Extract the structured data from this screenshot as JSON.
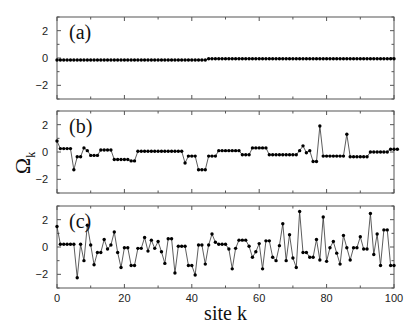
{
  "chart_data": {
    "type": "line",
    "xlabel": "site k",
    "ylabel": "Ω_k",
    "ylabel_main": "Ω",
    "ylabel_sub": "k",
    "xlim": [
      0,
      100
    ],
    "ylim": [
      -3,
      3
    ],
    "x_ticks": [
      0,
      20,
      40,
      60,
      80,
      100
    ],
    "y_ticks": [
      2,
      0,
      -2
    ],
    "y_tick_labels": [
      "2",
      "0",
      "−2"
    ],
    "x_tick_labels": [
      "0",
      "20",
      "40",
      "60",
      "80",
      "100"
    ],
    "grid": false,
    "markers": "filled-circle",
    "panels": [
      {
        "label": "(a)",
        "values": [
          -0.15,
          -0.15,
          -0.15,
          -0.15,
          -0.15,
          -0.15,
          -0.15,
          -0.15,
          -0.15,
          -0.15,
          -0.15,
          -0.15,
          -0.15,
          -0.15,
          -0.15,
          -0.15,
          -0.15,
          -0.15,
          -0.15,
          -0.15,
          -0.15,
          -0.15,
          -0.15,
          -0.15,
          -0.15,
          -0.15,
          -0.15,
          -0.15,
          -0.15,
          -0.15,
          -0.15,
          -0.15,
          -0.15,
          -0.15,
          -0.15,
          -0.15,
          -0.15,
          -0.15,
          -0.15,
          -0.15,
          -0.15,
          -0.15,
          -0.15,
          -0.15,
          -0.15,
          -0.05,
          -0.05,
          -0.05,
          -0.05,
          -0.05,
          -0.05,
          -0.05,
          -0.05,
          -0.05,
          -0.05,
          -0.05,
          -0.05,
          -0.05,
          -0.05,
          -0.05,
          -0.05,
          -0.05,
          -0.05,
          -0.05,
          -0.05,
          -0.05,
          -0.05,
          -0.05,
          -0.05,
          -0.05,
          -0.05,
          -0.05,
          -0.05,
          -0.05,
          -0.05,
          -0.05,
          -0.05,
          -0.05,
          -0.05,
          -0.05,
          -0.05,
          -0.05,
          -0.05,
          -0.05,
          -0.05,
          -0.05,
          -0.05,
          -0.05,
          -0.05,
          -0.05,
          -0.05,
          -0.05,
          -0.05,
          -0.05,
          -0.05,
          -0.05,
          -0.05,
          -0.05,
          -0.05,
          -0.05,
          -0.05
        ]
      },
      {
        "label": "(b)",
        "values": [
          0.8,
          0.25,
          0.25,
          0.25,
          0.25,
          -1.3,
          -0.35,
          -0.35,
          0.3,
          0.1,
          -0.25,
          -0.25,
          -0.25,
          0.15,
          0.15,
          0.15,
          0.15,
          -0.55,
          -0.55,
          -0.55,
          -0.55,
          -0.55,
          -0.65,
          -0.65,
          0.05,
          0.05,
          0.05,
          0.05,
          0.05,
          0.05,
          0.05,
          0.05,
          0.05,
          0.05,
          0.05,
          0.05,
          0.05,
          0.05,
          -0.8,
          -0.3,
          -0.3,
          -0.3,
          -1.3,
          -1.3,
          -1.3,
          -0.3,
          -0.3,
          -0.3,
          0.1,
          0.1,
          0.1,
          0.1,
          0.1,
          0.1,
          0.1,
          -0.2,
          -0.2,
          -0.2,
          0.3,
          0.3,
          0.3,
          0.3,
          0.3,
          -0.2,
          -0.2,
          -0.2,
          -0.2,
          -0.2,
          -0.2,
          -0.2,
          -0.2,
          -0.2,
          0.1,
          0.45,
          -0.05,
          0.1,
          -0.7,
          -0.7,
          1.9,
          -0.3,
          -0.3,
          -0.3,
          -0.3,
          -0.3,
          -0.3,
          -0.3,
          1.3,
          -0.35,
          -0.35,
          -0.35,
          -0.35,
          -0.35,
          -0.35,
          0.0,
          0.0,
          0.0,
          0.0,
          0.0,
          0.0,
          0.2,
          0.2,
          0.2
        ]
      },
      {
        "label": "(c)",
        "values": [
          1.5,
          0.2,
          0.2,
          0.2,
          0.2,
          0.2,
          -2.25,
          0.2,
          -1.0,
          1.6,
          0.15,
          -1.3,
          -0.4,
          -0.4,
          0.55,
          -0.15,
          0.15,
          1.1,
          -0.4,
          -1.5,
          -0.05,
          -0.05,
          -1.35,
          -1.35,
          -0.1,
          -0.1,
          0.7,
          -0.3,
          0.5,
          -0.1,
          0.4,
          -0.35,
          -1.2,
          0.6,
          0.6,
          -1.9,
          0.05,
          0.05,
          0.05,
          -1.35,
          -1.35,
          -2.05,
          0.15,
          0.15,
          -1.25,
          0.15,
          0.95,
          0.35,
          0.2,
          0.2,
          0.2,
          -0.15,
          -1.6,
          -0.1,
          0.5,
          0.5,
          0.5,
          0.05,
          -0.75,
          -0.35,
          0.25,
          -1.6,
          0.45,
          0.45,
          -0.75,
          -1.0,
          0.1,
          1.7,
          -1.0,
          0.9,
          -0.8,
          -1.5,
          2.6,
          -0.4,
          -0.4,
          -0.75,
          -0.75,
          0.55,
          -0.95,
          2.2,
          -1.05,
          -0.05,
          0.4,
          -0.45,
          -1.25,
          0.85,
          -0.05,
          -0.95,
          -0.05,
          -0.05,
          0.75,
          -0.15,
          -0.15,
          2.45,
          -0.55,
          0.95,
          -1.35,
          1.25,
          1.25,
          -1.35,
          -1.35
        ]
      }
    ]
  },
  "layout": {
    "plot_left": 57,
    "plot_right": 394,
    "panels_y": [
      [
        17,
        99
      ],
      [
        111,
        193
      ],
      [
        206,
        288
      ]
    ]
  }
}
